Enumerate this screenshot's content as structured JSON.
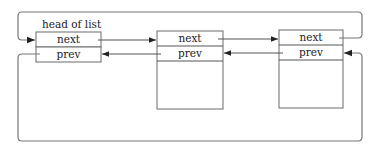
{
  "diagram": {
    "type": "circular doubly linked list",
    "head_label": "head of list",
    "nodes": [
      {
        "id": "head",
        "fields": [
          "next",
          "prev"
        ]
      },
      {
        "id": "node1",
        "fields": [
          "next",
          "prev"
        ]
      },
      {
        "id": "node2",
        "fields": [
          "next",
          "prev"
        ]
      }
    ],
    "edges": [
      {
        "from": "head.next",
        "to": "node1",
        "label": ""
      },
      {
        "from": "node1.next",
        "to": "node2",
        "label": ""
      },
      {
        "from": "node2.next",
        "to": "head",
        "label": "",
        "route": "top loop"
      },
      {
        "from": "node1.prev",
        "to": "head",
        "label": ""
      },
      {
        "from": "node2.prev",
        "to": "node1",
        "label": ""
      },
      {
        "from": "head.prev",
        "to": "node2",
        "label": "",
        "route": "bottom loop"
      }
    ],
    "labels": {
      "head_next": "next",
      "head_prev": "prev",
      "n1_next": "next",
      "n1_prev": "prev",
      "n2_next": "next",
      "n2_prev": "prev"
    },
    "colors": {
      "stroke": "#555555",
      "background": "#ffffff"
    }
  }
}
